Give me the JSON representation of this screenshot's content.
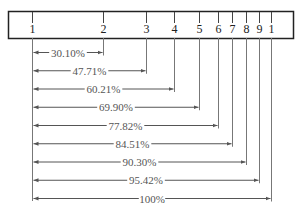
{
  "chart_data": {
    "type": "diagram",
    "title": "",
    "scale": {
      "tick_labels": [
        "1",
        "2",
        "3",
        "4",
        "5",
        "6",
        "7",
        "8",
        "9",
        "1"
      ],
      "tick_x": [
        32,
        103,
        146,
        174,
        199,
        218,
        232,
        246,
        259,
        271
      ]
    },
    "measurements": [
      {
        "to": "2",
        "label": "30.10%",
        "value": 30.1
      },
      {
        "to": "3",
        "label": "47.71%",
        "value": 47.71
      },
      {
        "to": "4",
        "label": "60.21%",
        "value": 60.21
      },
      {
        "to": "5",
        "label": "69.90%",
        "value": 69.9
      },
      {
        "to": "6",
        "label": "77.82%",
        "value": 77.82
      },
      {
        "to": "7",
        "label": "84.51%",
        "value": 84.51
      },
      {
        "to": "8",
        "label": "90.30%",
        "value": 90.3
      },
      {
        "to": "9",
        "label": "95.42%",
        "value": 95.42
      },
      {
        "to": "1",
        "label": "100%",
        "value": 100
      }
    ]
  },
  "colors": {
    "line": "#555555",
    "box": "#222222",
    "text": "#444444"
  }
}
